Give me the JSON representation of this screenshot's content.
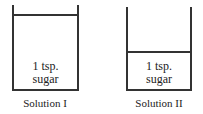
{
  "diagram": {
    "solutions": [
      {
        "name": "Solution I",
        "contents_line1": "1 tsp.",
        "contents_line2": "sugar",
        "fill": "high"
      },
      {
        "name": "Solution II",
        "contents_line1": "1 tsp.",
        "contents_line2": "sugar",
        "fill": "low"
      }
    ]
  }
}
